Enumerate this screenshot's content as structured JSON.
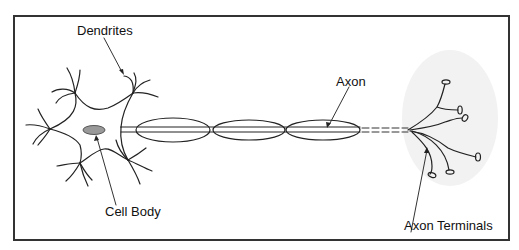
{
  "diagram": {
    "type": "neuron",
    "colors": {
      "border": "#333333",
      "line": "#222222",
      "nucleus": "#999999",
      "terminal_glow": "#eeeeee",
      "background": "#ffffff"
    },
    "labels": {
      "dendrites": "Dendrites",
      "axon": "Axon",
      "cell_body": "Cell Body",
      "axon_terminals": "Axon Terminals"
    },
    "parts": [
      "dendrites",
      "cell-body",
      "nucleus",
      "myelin-sheath-segments",
      "axon",
      "axon-terminals"
    ],
    "myelin_segments": 3,
    "terminal_count": 6
  }
}
